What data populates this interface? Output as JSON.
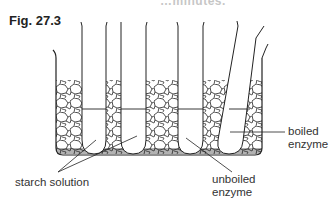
{
  "figure": {
    "title": "Fig. 27.3",
    "header_fragment": "…minutes."
  },
  "labels": {
    "starch_solution": "starch solution",
    "unboiled_enzyme_line1": "unboiled",
    "unboiled_enzyme_line2": "enzyme",
    "boiled_enzyme_line1": "boiled",
    "boiled_enzyme_line2": "enzyme"
  },
  "diagram": {
    "components": [
      "beaker (water bath)",
      "crushed ice / gravel",
      "test tube 1",
      "test tube 2",
      "test tube 3",
      "test tube 4 (tilted)",
      "water level line"
    ],
    "colors": {
      "line": "#222222",
      "fill": "#ffffff"
    }
  }
}
